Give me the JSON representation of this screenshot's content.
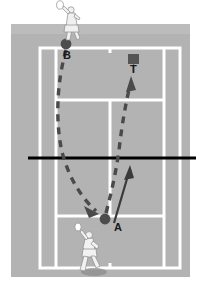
{
  "diagram": {
    "surface_color": "#b0b0b0",
    "outside_color": "#e4e4e4",
    "line_color": "#ffffff",
    "net_color": "#000000",
    "marker_color": "#4d4d4d",
    "trajectory_color": "#4a4a4a",
    "arrow_color": "#333333"
  },
  "labels": {
    "player_a": "A",
    "player_b": "B",
    "target_t": "T"
  },
  "markers": [
    {
      "id": "ball-b",
      "label": "B",
      "shape": "circle",
      "x": 66,
      "y": 44
    },
    {
      "id": "ball-a",
      "label": "A",
      "shape": "circle",
      "x": 105,
      "y": 219
    },
    {
      "id": "target-t",
      "label": "T",
      "shape": "square",
      "x": 133,
      "y": 59
    }
  ],
  "players": [
    {
      "id": "player-top",
      "label": "B",
      "x": 70,
      "y": 26
    },
    {
      "id": "player-bottom",
      "label": "A",
      "x": 92,
      "y": 248
    }
  ],
  "court": {
    "surface": {
      "x": 11,
      "y": 24,
      "width": 179,
      "height": 253
    },
    "doubles": {
      "x": 40,
      "y": 48,
      "width": 140,
      "height": 220
    },
    "singles_left_x": 55,
    "singles_right_x": 165,
    "service_line_top_y": 100,
    "service_line_bottom_y": 216,
    "center_service_x": 110,
    "net_y": 158,
    "net_x1": 28,
    "net_x2": 196
  },
  "trajectories": [
    {
      "id": "ball-path-b-to-a",
      "style": "dashed",
      "from": "B",
      "to": "A",
      "description": "Curved dashed ball path from B down to the arrowhead near A"
    },
    {
      "id": "ball-path-a-to-t",
      "style": "dashed",
      "from": "A",
      "to": "T",
      "description": "Curved dashed ball path from A up to the target T"
    },
    {
      "id": "player-movement-arrow",
      "style": "solid",
      "from": "A",
      "to": "net",
      "description": "Solid arrow showing player A moving forward toward the net"
    }
  ]
}
